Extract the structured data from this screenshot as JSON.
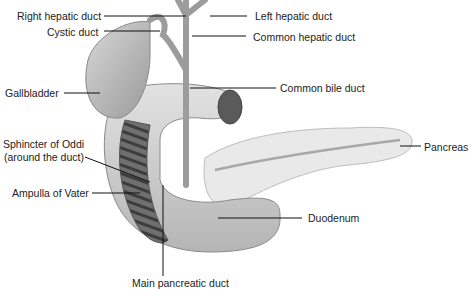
{
  "diagram": {
    "type": "anatomical illustration",
    "labels": {
      "right_hepatic_duct": "Right hepatic duct",
      "left_hepatic_duct": "Left hepatic duct",
      "cystic_duct": "Cystic duct",
      "common_hepatic_duct": "Common hepatic duct",
      "gallbladder": "Gallbladder",
      "common_bile_duct": "Common bile duct",
      "sphincter_line1": "Sphincter of Oddi",
      "sphincter_line2": "(around the duct)",
      "pancreas": "Pancreas",
      "ampulla": "Ampulla of Vater",
      "duodenum": "Duodenum",
      "main_pancreatic_duct": "Main pancreatic duct"
    }
  }
}
